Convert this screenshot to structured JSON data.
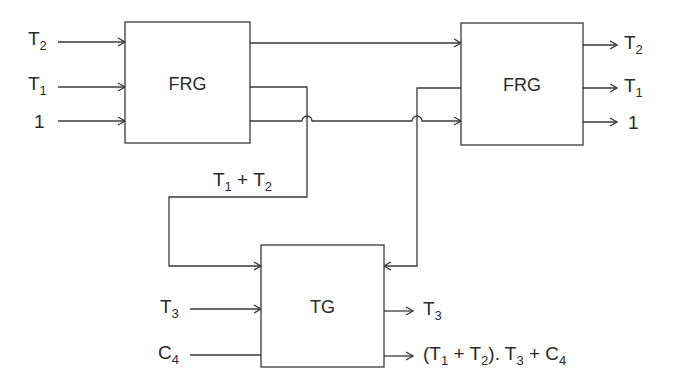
{
  "diagram": {
    "blocks": {
      "frg1": {
        "label": "FRG"
      },
      "frg2": {
        "label": "FRG"
      },
      "tg": {
        "label": "TG"
      }
    },
    "frg1_inputs": [
      {
        "base": "T",
        "sub": "2"
      },
      {
        "base": "T",
        "sub": "1"
      },
      {
        "base": "1",
        "sub": ""
      }
    ],
    "frg2_outputs": [
      {
        "base": "T",
        "sub": "2"
      },
      {
        "base": "T",
        "sub": "1"
      },
      {
        "base": "1",
        "sub": ""
      }
    ],
    "intermediate_label": {
      "t1": "T",
      "s1": "1",
      "op": " + ",
      "t2": "T",
      "s2": "2"
    },
    "tg_inputs": [
      {
        "base": "T",
        "sub": "3"
      },
      {
        "base": "C",
        "sub": "4"
      }
    ],
    "tg_outputs": {
      "out1": {
        "base": "T",
        "sub": "3"
      },
      "out2": {
        "p1": "(T",
        "s1": "1",
        "p2": " + T",
        "s2": "2",
        "p3": "). T",
        "s3": "3",
        "p4": " + C",
        "s4": "4"
      }
    },
    "colors": {
      "line": "#3a3a3a",
      "text": "#2a2a2a",
      "background": "#ffffff"
    }
  }
}
